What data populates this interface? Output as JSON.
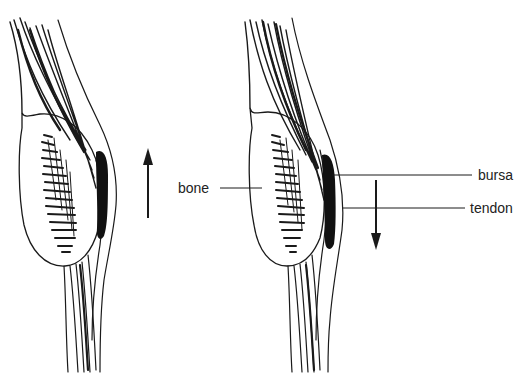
{
  "diagram": {
    "type": "anatomical-illustration",
    "panels": [
      {
        "id": "left",
        "arrow_direction": "up",
        "description": "tendon moving upward over bone with bursa"
      },
      {
        "id": "right",
        "arrow_direction": "down",
        "description": "tendon moving downward over bone with bursa"
      }
    ],
    "labels": {
      "bone": "bone",
      "bursa": "bursa",
      "tendon": "tendon"
    },
    "colors": {
      "ink": "#1a1a1a",
      "bursa_fill": "#111111",
      "background": "#ffffff"
    }
  }
}
